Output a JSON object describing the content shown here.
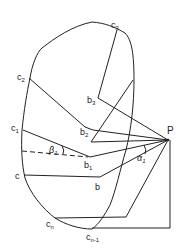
{
  "diagram": {
    "point_P": "P",
    "labels": {
      "c3": "c",
      "c3_sub": "3",
      "b3": "b",
      "b3_sub": "3",
      "c2": "c",
      "c2_sub": "2",
      "b2": "b",
      "b2_sub": "2",
      "c1": "c",
      "c1_sub": "1",
      "b1": "b",
      "b1_sub": "1",
      "c": "c",
      "b": "b",
      "cn": "c",
      "cn_sub": "n",
      "cn1": "c",
      "cn1_sub": "n-1",
      "beta": "β",
      "beta_sub": "1",
      "alpha": "α",
      "alpha_sub": "1"
    },
    "colors": {
      "stroke": "#222222",
      "background": "#ffffff"
    }
  }
}
